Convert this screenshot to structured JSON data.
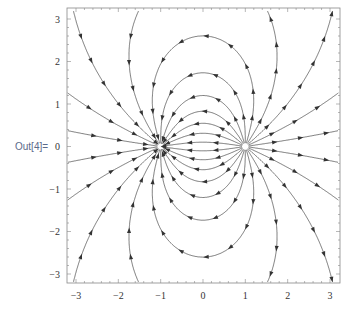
{
  "cell": {
    "output_label": "Out[4]="
  },
  "colors": {
    "stream": "#555555",
    "frame": "#888888",
    "arrow": "#333333",
    "label": "#5a6a8a"
  },
  "chart_data": {
    "type": "streamplot",
    "title": "",
    "field": "E = (r - p)/|r - p|^3 - (r - n)/|r - n|^3",
    "charges": [
      {
        "x": 1,
        "y": 0,
        "sign": "+",
        "role": "source"
      },
      {
        "x": -1,
        "y": 0,
        "sign": "-",
        "role": "sink"
      }
    ],
    "xlim": [
      -3.2,
      3.2
    ],
    "ylim": [
      -3.2,
      3.2
    ],
    "xticks": [
      "-3",
      "-2",
      "-1",
      "0",
      "1",
      "2",
      "3"
    ],
    "yticks": [
      "3",
      "2",
      "1",
      "0",
      "-1",
      "-2",
      "-3"
    ],
    "xlabel": "",
    "ylabel": "",
    "frame": true,
    "grid": false,
    "legend": null
  },
  "plot": {
    "frame": {
      "left": 67,
      "top": 8,
      "right": 340,
      "bottom": 283
    },
    "x_map": {
      "v_at_minus3": 76,
      "v_at_plus3": 330
    },
    "y_map": {
      "v_at_plus3": 19,
      "v_at_minus3": 274
    },
    "n_seeds_per_charge": 22
  }
}
